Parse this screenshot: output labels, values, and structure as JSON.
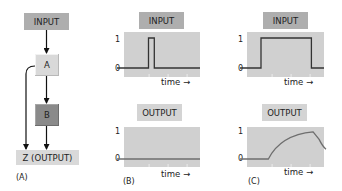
{
  "panel_a": {
    "label": "(A)",
    "nodes": {
      "input": "INPUT",
      "a": "A",
      "b": "B",
      "z": "Z (OUTPUT)"
    }
  },
  "panel_b": {
    "label": "(B)",
    "input_title": "INPUT",
    "output_title": "OUTPUT",
    "y_ticks": [
      "1",
      "0"
    ],
    "x_label": "time",
    "arrow": "→"
  },
  "panel_c": {
    "label": "(C)",
    "input_title": "INPUT",
    "output_title": "OUTPUT",
    "y_ticks": [
      "1",
      "0"
    ],
    "x_label": "time",
    "arrow": "→"
  },
  "colors": {
    "badge_input": "#aeaeae",
    "badge_output": "#d4d4d4",
    "plot_bg": "#d0d0d0",
    "node_a": "#d9d9d9",
    "node_b": "#8a8a8a",
    "trace_input": "#333333",
    "trace_output": "#6e6e6e"
  },
  "chart_data": [
    {
      "type": "line",
      "title": "INPUT",
      "panel": "B",
      "xlabel": "time",
      "ylabel": "",
      "ylim": [
        0,
        1
      ],
      "x": [
        0,
        0.38,
        0.38,
        0.45,
        0.45,
        1
      ],
      "values": [
        0,
        0,
        1,
        1,
        0,
        0
      ]
    },
    {
      "type": "line",
      "title": "OUTPUT",
      "panel": "B",
      "xlabel": "time",
      "ylabel": "",
      "ylim": [
        0,
        1
      ],
      "x": [
        0,
        1
      ],
      "values": [
        0,
        0
      ]
    },
    {
      "type": "line",
      "title": "INPUT",
      "panel": "C",
      "xlabel": "time",
      "ylabel": "",
      "ylim": [
        0,
        1
      ],
      "x": [
        0,
        0.25,
        0.25,
        0.85,
        0.85,
        1
      ],
      "values": [
        0,
        0,
        1,
        1,
        0,
        0
      ]
    },
    {
      "type": "line",
      "title": "OUTPUT",
      "panel": "C",
      "xlabel": "time",
      "ylabel": "",
      "ylim": [
        0,
        1
      ],
      "x": [
        0,
        0.33,
        0.45,
        0.6,
        0.75,
        0.85,
        0.95,
        1
      ],
      "values": [
        0,
        0,
        0.5,
        0.78,
        0.93,
        0.97,
        0.55,
        0.35
      ]
    }
  ]
}
